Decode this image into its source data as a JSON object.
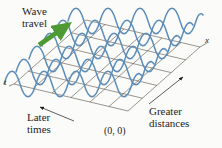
{
  "figure": {
    "title_alt": "Wave on a string shown as a function of position and time",
    "background_color": "#fbfbfa",
    "labels": {
      "wave_travel": "Wave\ntravel",
      "later_times": "Later\ntimes",
      "greater_distances": "Greater\ndistances",
      "origin": "(0, 0)",
      "x_axis": "x",
      "t_axis": "t"
    },
    "colors": {
      "wave_curve": "#5b8db8",
      "grid_line": "#3a3226",
      "arrow_green": "#4e9b36",
      "arrow_black": "#1a1a1a",
      "text": "#1c1c1c"
    },
    "geometry": {
      "parallelogram": {
        "left_vertex": [
          14,
          84
        ],
        "top_vertex": [
          86,
          20
        ],
        "right_vertex": [
          200,
          47
        ],
        "bottom_vertex": [
          128,
          111
        ]
      },
      "grid_rows": 6,
      "grid_cols": 6
    },
    "waves": {
      "count": 6,
      "cycles_per_wave": 4,
      "amplitude_px": 17,
      "description": "sinusoidal wave trains drawn along lines of constant time, offset progressively to show propagation"
    },
    "arrows": {
      "wave_travel": {
        "from": [
          40,
          44
        ],
        "to": [
          71,
          23
        ],
        "color": "#4e9b36",
        "meaning": "direction of wave propagation"
      },
      "later_times": {
        "from": [
          72,
          120
        ],
        "to": [
          40,
          107
        ],
        "color": "#1a1a1a",
        "meaning": "increasing time toward lower left"
      },
      "greater_distances": {
        "from": [
          150,
          103
        ],
        "to": [
          183,
          78
        ],
        "color": "#1a1a1a",
        "meaning": "increasing distance toward upper right"
      }
    }
  }
}
